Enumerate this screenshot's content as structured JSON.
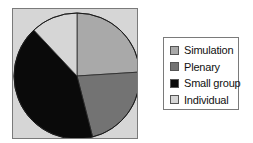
{
  "chart_data": {
    "type": "pie",
    "title": "",
    "categories": [
      "Simulation",
      "Plenary",
      "Small group",
      "Individual"
    ],
    "values": [
      24,
      22,
      42,
      12
    ],
    "units": "percent (estimated from slice angles)",
    "start_angle": "12 o'clock, clockwise",
    "colors": [
      "#a9a9a9",
      "#737373",
      "#0a0a0a",
      "#d6d6d6"
    ],
    "legend_position": "right",
    "plot_background": "#d6d6d6"
  },
  "legend": {
    "items": [
      {
        "label": "Simulation",
        "color": "#a9a9a9"
      },
      {
        "label": "Plenary",
        "color": "#737373"
      },
      {
        "label": "Small group",
        "color": "#0a0a0a"
      },
      {
        "label": "Individual",
        "color": "#d6d6d6"
      }
    ]
  }
}
